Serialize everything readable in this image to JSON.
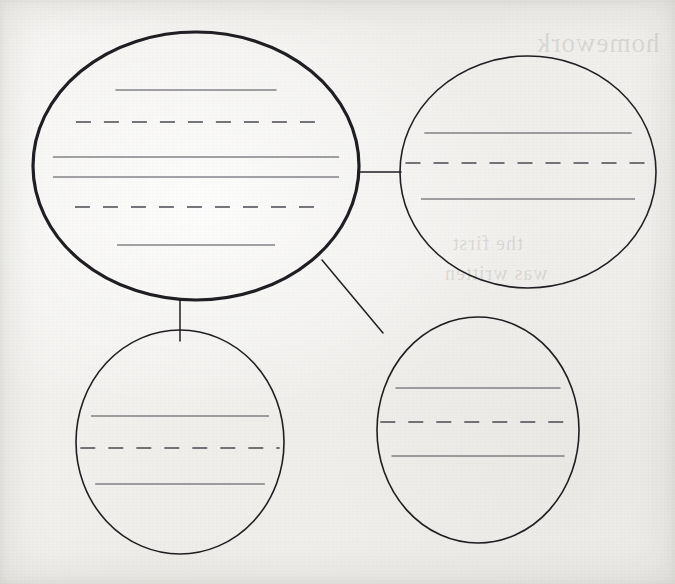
{
  "document": {
    "kind": "graphic-organizer-worksheet",
    "title": "Blank Bubble Map Graphic Organizer",
    "page_width": 675,
    "page_height": 584,
    "paper_color": "#f2f1ef",
    "ink_color": "#1f1f23",
    "rule_color": "#4a4a52",
    "bubble_count": 4,
    "connector_count": 3
  },
  "bubbles": [
    {
      "id": "main-bubble",
      "role": "central-topic",
      "label": "Central topic bubble",
      "cx": 196,
      "cy": 166,
      "rx": 163,
      "ry": 134,
      "stroke_width": 3.2,
      "writing_lines": [
        {
          "style": "solid",
          "y": 90,
          "inset": 0.4
        },
        {
          "style": "dashed",
          "y": 122,
          "inset": 0.22
        },
        {
          "style": "solid",
          "y": 157,
          "inset": 0.12
        },
        {
          "style": "solid",
          "y": 177,
          "inset": 0.12
        },
        {
          "style": "dashed",
          "y": 207,
          "inset": 0.22
        },
        {
          "style": "solid",
          "y": 245,
          "inset": 0.4
        }
      ]
    },
    {
      "id": "bubble-top-right",
      "role": "detail",
      "label": "Top right detail bubble",
      "cx": 528,
      "cy": 172,
      "rx": 128,
      "ry": 116,
      "stroke_width": 1.6,
      "writing_lines": [
        {
          "style": "solid",
          "y": 133,
          "inset": 0.14
        },
        {
          "style": "dashed",
          "y": 163,
          "inset": 0.04
        },
        {
          "style": "solid",
          "y": 199,
          "inset": 0.14
        }
      ]
    },
    {
      "id": "bubble-bottom-left",
      "role": "detail",
      "label": "Bottom left detail bubble",
      "cx": 180,
      "cy": 442,
      "rx": 104,
      "ry": 112,
      "stroke_width": 1.6,
      "writing_lines": [
        {
          "style": "solid",
          "y": 416,
          "inset": 0.12
        },
        {
          "style": "dashed",
          "y": 448,
          "inset": 0.04
        },
        {
          "style": "solid",
          "y": 484,
          "inset": 0.12
        }
      ]
    },
    {
      "id": "bubble-bottom-right",
      "role": "detail",
      "label": "Bottom right detail bubble",
      "cx": 478,
      "cy": 430,
      "rx": 101,
      "ry": 113,
      "stroke_width": 1.6,
      "writing_lines": [
        {
          "style": "solid",
          "y": 388,
          "inset": 0.12
        },
        {
          "style": "dashed",
          "y": 422,
          "inset": 0.03
        },
        {
          "style": "solid",
          "y": 456,
          "inset": 0.12
        }
      ]
    }
  ],
  "connectors": [
    {
      "id": "connector-main-to-top-right",
      "label": "Connector to top right bubble",
      "x1": 358,
      "y1": 172,
      "x2": 401,
      "y2": 172,
      "orientation": "horizontal"
    },
    {
      "id": "connector-main-to-bottom-left",
      "label": "Connector to bottom left bubble",
      "x1": 180,
      "y1": 299,
      "x2": 180,
      "y2": 341,
      "orientation": "vertical"
    },
    {
      "id": "connector-main-to-bottom-right",
      "label": "Connector to bottom right bubble",
      "x1": 322,
      "y1": 260,
      "x2": 383,
      "y2": 333,
      "orientation": "diagonal"
    }
  ],
  "bleed_through": [
    {
      "id": "bleed-top-right",
      "text": "homework",
      "x": 536,
      "y": 28,
      "size": 27
    },
    {
      "id": "bleed-middle-right",
      "text": "the first",
      "x": 452,
      "y": 232,
      "size": 20
    },
    {
      "id": "bleed-lower-right",
      "text": "was written",
      "x": 444,
      "y": 262,
      "size": 20
    }
  ]
}
